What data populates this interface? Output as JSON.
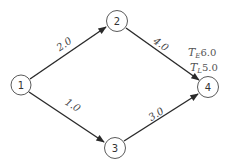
{
  "diagram": {
    "type": "activity-network",
    "nodes": [
      {
        "id": "1",
        "label": "1",
        "cx": 21,
        "cy": 85,
        "r": 10
      },
      {
        "id": "2",
        "label": "2",
        "cx": 117,
        "cy": 21,
        "r": 10.5
      },
      {
        "id": "3",
        "label": "3",
        "cx": 115,
        "cy": 148,
        "r": 10.5
      },
      {
        "id": "4",
        "label": "4",
        "cx": 208,
        "cy": 87,
        "r": 10.5
      }
    ],
    "edges": [
      {
        "from": "1",
        "to": "2",
        "label": "2.0"
      },
      {
        "from": "1",
        "to": "3",
        "label": "1.0"
      },
      {
        "from": "2",
        "to": "4",
        "label": "4.0"
      },
      {
        "from": "3",
        "to": "4",
        "label": "3.0"
      }
    ],
    "annotation": {
      "te_symbol": "T",
      "te_sub": "E",
      "te_value": "6.0",
      "tl_symbol": "T",
      "tl_sub": "L",
      "tl_value": "5.0"
    },
    "colors": {
      "line": "#2a2a2a",
      "circle": "#5a5a5a",
      "text": "#444444"
    }
  }
}
